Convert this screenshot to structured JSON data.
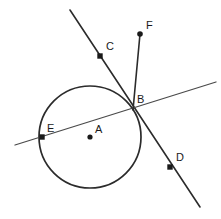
{
  "figure": {
    "background_color": "#ffffff",
    "stroke_color": "#2b2b2b",
    "point_color": "#1a1a1a",
    "width": 221,
    "height": 219
  },
  "circle": {
    "name": "circle-A",
    "center_label": "A",
    "center_x": 90,
    "center_y": 137,
    "radius": 51
  },
  "points": [
    {
      "label": "A",
      "role": "circle-center",
      "x": 90,
      "y": 137,
      "marker": "dot",
      "label_x": 95,
      "label_y": 133
    },
    {
      "label": "B",
      "role": "intersection-on-circle",
      "x": 133,
      "y": 108,
      "marker": "none",
      "label_x": 137,
      "label_y": 103
    },
    {
      "label": "C",
      "role": "point-on-line-cd",
      "x": 100,
      "y": 56,
      "marker": "square",
      "label_x": 106,
      "label_y": 50
    },
    {
      "label": "D",
      "role": "point-on-line-cd",
      "x": 170,
      "y": 167,
      "marker": "square",
      "label_x": 176,
      "label_y": 161
    },
    {
      "label": "E",
      "role": "point-on-secant",
      "x": 42,
      "y": 137,
      "marker": "square",
      "label_x": 47,
      "label_y": 132
    },
    {
      "label": "F",
      "role": "endpoint-of-ray-bf",
      "x": 140,
      "y": 34,
      "marker": "dot",
      "label_x": 146,
      "label_y": 29
    }
  ],
  "lines": [
    {
      "name": "line-cd",
      "description": "line through C and D crossing the circle at B",
      "x1": 70,
      "y1": 10,
      "x2": 200,
      "y2": 207,
      "weight": "thick"
    },
    {
      "name": "line-eb",
      "description": "secant line through E and B",
      "x1": 15,
      "y1": 145,
      "x2": 216,
      "y2": 82,
      "weight": "thin"
    },
    {
      "name": "ray-bf",
      "description": "ray from B to F",
      "x1": 133,
      "y1": 110,
      "x2": 140,
      "y2": 34,
      "weight": "thick"
    }
  ],
  "labels": {
    "a": "A",
    "b": "B",
    "c": "C",
    "d": "D",
    "e": "E",
    "f": "F"
  }
}
